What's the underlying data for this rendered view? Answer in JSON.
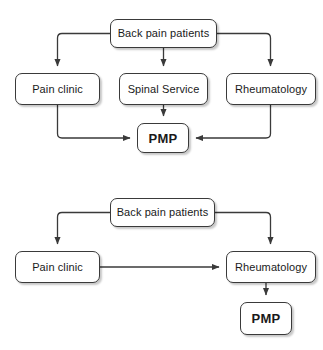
{
  "figure": {
    "type": "flowchart",
    "orientation": "vertical-stacked",
    "panel_count": 2,
    "style": {
      "node_fill": "#ffffff",
      "node_stroke": "#3a3a3a",
      "edge_stroke": "#3a3a3a",
      "text_color": "#1a1a1a",
      "background": "#ffffff"
    }
  },
  "panels": [
    {
      "id": "top-pathway",
      "nodes": [
        {
          "id": "t-back-pain",
          "label": "Back pain patients",
          "bold": false,
          "x": 110,
          "y": 19,
          "w": 107,
          "h": 29
        },
        {
          "id": "t-pain-clinic",
          "label": "Pain clinic",
          "bold": false,
          "x": 15,
          "y": 73,
          "w": 85,
          "h": 32
        },
        {
          "id": "t-spinal",
          "label": "Spinal Service",
          "bold": false,
          "x": 119,
          "y": 73,
          "w": 89,
          "h": 32
        },
        {
          "id": "t-rheum",
          "label": "Rheumatology",
          "bold": false,
          "x": 226,
          "y": 73,
          "w": 90,
          "h": 32
        },
        {
          "id": "t-pmp",
          "label": "PMP",
          "bold": true,
          "x": 137,
          "y": 123,
          "w": 52,
          "h": 30
        }
      ],
      "edges": [
        {
          "from": "t-back-pain",
          "to": "t-pain-clinic",
          "route": "left-elbow"
        },
        {
          "from": "t-back-pain",
          "to": "t-spinal",
          "route": "straight-down"
        },
        {
          "from": "t-back-pain",
          "to": "t-rheum",
          "route": "right-elbow"
        },
        {
          "from": "t-pain-clinic",
          "to": "t-pmp",
          "route": "down-then-right"
        },
        {
          "from": "t-spinal",
          "to": "t-pmp",
          "route": "straight-down"
        },
        {
          "from": "t-rheum",
          "to": "t-pmp",
          "route": "down-then-left"
        }
      ]
    },
    {
      "id": "bottom-pathway",
      "nodes": [
        {
          "id": "b-back-pain",
          "label": "Back pain patients",
          "bold": false,
          "x": 110,
          "y": 23,
          "w": 105,
          "h": 29
        },
        {
          "id": "b-pain-clinic",
          "label": "Pain clinic",
          "bold": false,
          "x": 15,
          "y": 76,
          "w": 85,
          "h": 32
        },
        {
          "id": "b-rheum",
          "label": "Rheumatology",
          "bold": false,
          "x": 226,
          "y": 76,
          "w": 90,
          "h": 32
        },
        {
          "id": "b-pmp",
          "label": "PMP",
          "bold": true,
          "x": 240,
          "y": 127,
          "w": 52,
          "h": 33
        }
      ],
      "edges": [
        {
          "from": "b-back-pain",
          "to": "b-pain-clinic",
          "route": "left-elbow"
        },
        {
          "from": "b-back-pain",
          "to": "b-rheum",
          "route": "right-elbow"
        },
        {
          "from": "b-pain-clinic",
          "to": "b-rheum",
          "route": "straight-right"
        },
        {
          "from": "b-rheum",
          "to": "b-pmp",
          "route": "straight-down"
        }
      ]
    }
  ]
}
